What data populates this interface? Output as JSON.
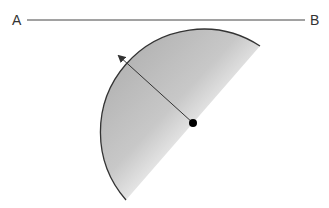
{
  "diagram": {
    "labels": {
      "left_point": "A",
      "right_point": "B"
    },
    "line": {
      "from": "A",
      "to": "B",
      "y": 20
    },
    "arc": {
      "center": [
        193,
        123
      ],
      "radius": 103,
      "tangent_to": "line AB"
    },
    "radius_arrow": {
      "from": [
        193,
        123
      ],
      "to": [
        118,
        55
      ]
    },
    "colors": {
      "stroke": "#333333",
      "fill_gradient_start": "#b0b0b0",
      "fill_gradient_end": "#ffffff",
      "center_dot": "#000000"
    }
  }
}
